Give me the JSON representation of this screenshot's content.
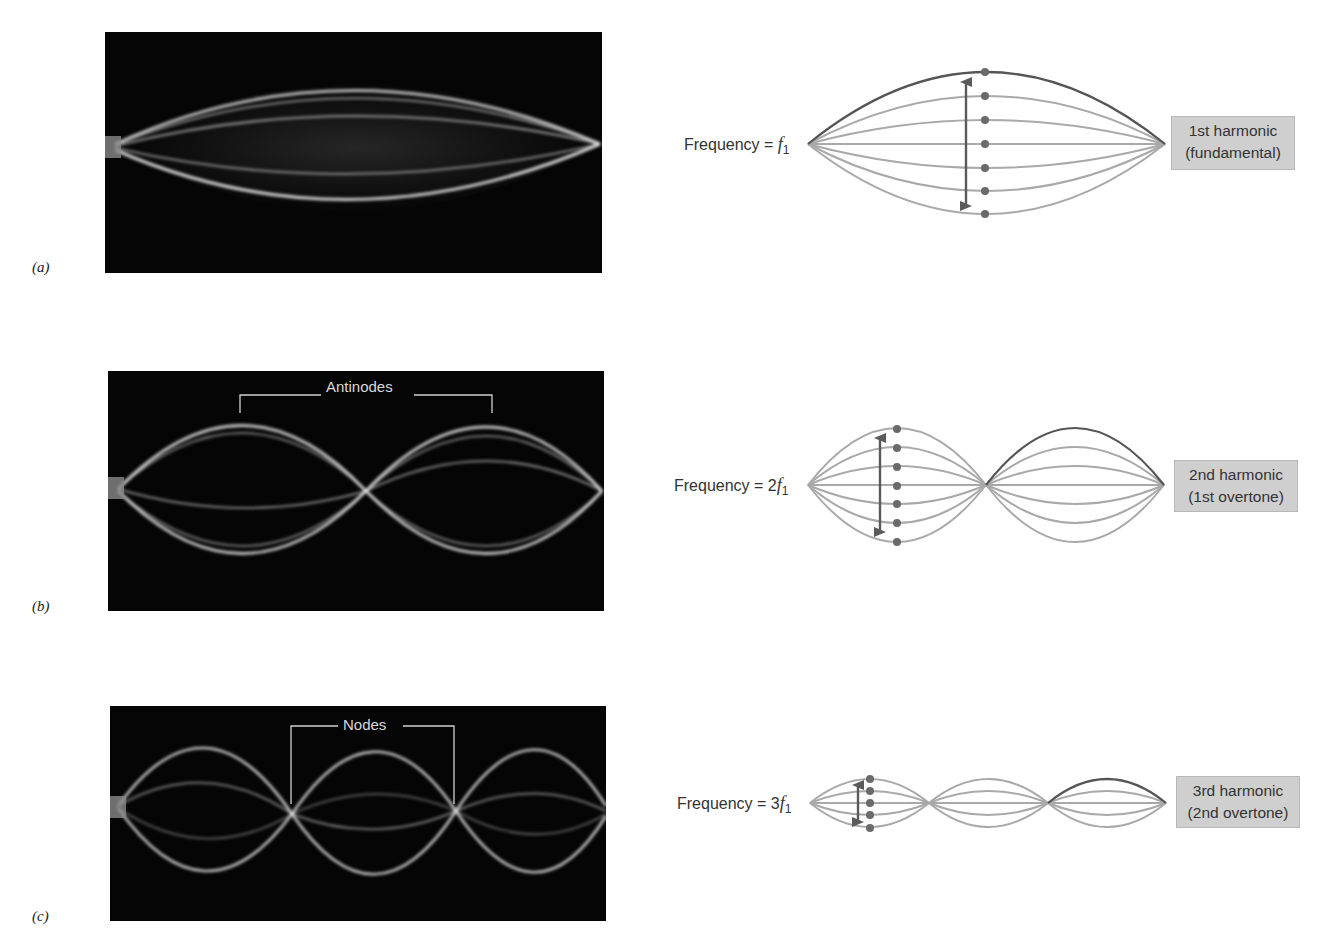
{
  "panels": [
    {
      "id": "a",
      "label": "(a)",
      "frequency_prefix": "Frequency = ",
      "frequency_coef": "",
      "frequency_var": "f",
      "frequency_sub": "1",
      "harmonic_line1": "1st harmonic",
      "harmonic_line2": "(fundamental)",
      "loops": 1
    },
    {
      "id": "b",
      "label": "(b)",
      "frequency_prefix": "Frequency = ",
      "frequency_coef": "2",
      "frequency_var": "f",
      "frequency_sub": "1",
      "harmonic_line1": "2nd harmonic",
      "harmonic_line2": "(1st overtone)",
      "loops": 2,
      "photo_annotation": "Antinodes"
    },
    {
      "id": "c",
      "label": "(c)",
      "frequency_prefix": "Frequency = ",
      "frequency_coef": "3",
      "frequency_var": "f",
      "frequency_sub": "1",
      "harmonic_line1": "3rd harmonic",
      "harmonic_line2": "(2nd overtone)",
      "loops": 3,
      "photo_annotation": "Nodes"
    }
  ],
  "colors": {
    "string_light": "#a9a9a9",
    "string_dark": "#555555",
    "arrow": "#5a5a5a",
    "dot": "#6a6a6a",
    "label_box": "#cfcfcf",
    "photo_bg": "#050505"
  }
}
